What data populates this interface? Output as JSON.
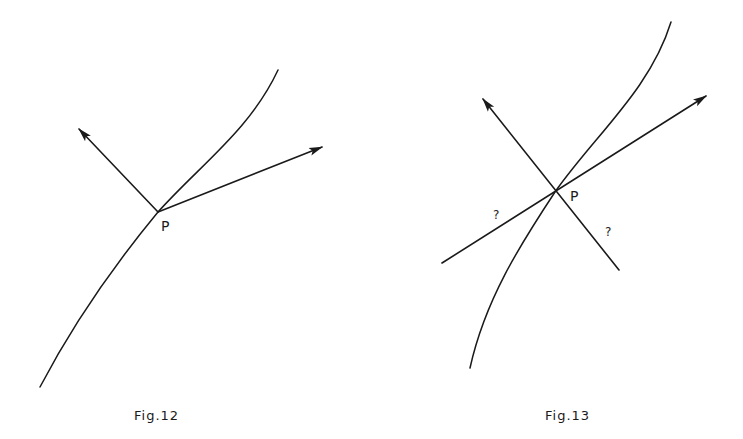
{
  "figures": [
    {
      "id": "fig12",
      "caption": "Fig.12",
      "point_label": "P",
      "description": "Curve through point P with normal and tangent arrows emanating from P"
    },
    {
      "id": "fig13",
      "caption": "Fig.13",
      "point_label": "P",
      "question_marks": [
        "?",
        "?"
      ],
      "description": "Curve through point P with normal and tangent lines crossing at P; backward extensions marked with question marks"
    }
  ],
  "colors": {
    "background": "#ffffff",
    "ink": "#1a1a1a"
  }
}
